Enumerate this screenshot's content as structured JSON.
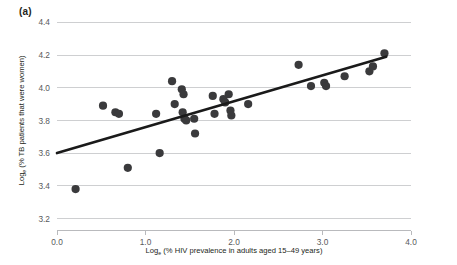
{
  "figure": {
    "panel_label": "(a)"
  },
  "chart_data": {
    "type": "scatter",
    "title": "",
    "xlabel": "Logₑ (% HIV prevalence in adults aged 15–49 years)",
    "xlabel_main_prefix": "Log",
    "xlabel_subscript": "e",
    "xlabel_main_rest": " (% HIV prevalence in adults aged 15–49 years)",
    "ylabel": "Logₑ (% TB patients that were women)",
    "ylabel_main_prefix": "Log",
    "ylabel_subscript": "e",
    "ylabel_main_rest": " (% TB patients that were women)",
    "xlim": [
      0.0,
      4.0
    ],
    "ylim": [
      3.2,
      4.4
    ],
    "xticks": [
      0.0,
      1.0,
      2.0,
      3.0,
      4.0
    ],
    "xtick_labels": [
      "0.0",
      "1.0",
      "2.0",
      "3.0",
      "4.0"
    ],
    "yticks": [
      3.2,
      3.4,
      3.6,
      3.8,
      4.0,
      4.2,
      4.4
    ],
    "ytick_labels": [
      "3.2",
      "3.4",
      "3.6",
      "3.8",
      "4.0",
      "4.2",
      "4.4"
    ],
    "grid": "horizontal",
    "legend": "none",
    "marker_color": "#3a3a3c",
    "marker_size_px": 5.0,
    "trendline_color": "#1a1a1a",
    "trendline": {
      "x_start": 0.0,
      "y_start": 3.6,
      "x_end": 3.72,
      "y_end": 4.19
    },
    "points": [
      {
        "x": 0.21,
        "y": 3.38
      },
      {
        "x": 0.52,
        "y": 3.89
      },
      {
        "x": 0.66,
        "y": 3.85
      },
      {
        "x": 0.7,
        "y": 3.84
      },
      {
        "x": 0.8,
        "y": 3.51
      },
      {
        "x": 1.12,
        "y": 3.84
      },
      {
        "x": 1.16,
        "y": 3.6
      },
      {
        "x": 1.3,
        "y": 4.04
      },
      {
        "x": 1.33,
        "y": 3.9
      },
      {
        "x": 1.41,
        "y": 3.99
      },
      {
        "x": 1.43,
        "y": 3.96
      },
      {
        "x": 1.42,
        "y": 3.85
      },
      {
        "x": 1.44,
        "y": 3.81
      },
      {
        "x": 1.46,
        "y": 3.8
      },
      {
        "x": 1.55,
        "y": 3.81
      },
      {
        "x": 1.56,
        "y": 3.72
      },
      {
        "x": 1.76,
        "y": 3.95
      },
      {
        "x": 1.78,
        "y": 3.84
      },
      {
        "x": 1.88,
        "y": 3.93
      },
      {
        "x": 1.9,
        "y": 3.91
      },
      {
        "x": 1.94,
        "y": 3.96
      },
      {
        "x": 1.96,
        "y": 3.86
      },
      {
        "x": 1.97,
        "y": 3.83
      },
      {
        "x": 2.16,
        "y": 3.9
      },
      {
        "x": 2.73,
        "y": 4.14
      },
      {
        "x": 2.87,
        "y": 4.01
      },
      {
        "x": 3.02,
        "y": 4.03
      },
      {
        "x": 3.04,
        "y": 4.01
      },
      {
        "x": 3.25,
        "y": 4.07
      },
      {
        "x": 3.53,
        "y": 4.1
      },
      {
        "x": 3.57,
        "y": 4.13
      },
      {
        "x": 3.7,
        "y": 4.21
      }
    ]
  }
}
